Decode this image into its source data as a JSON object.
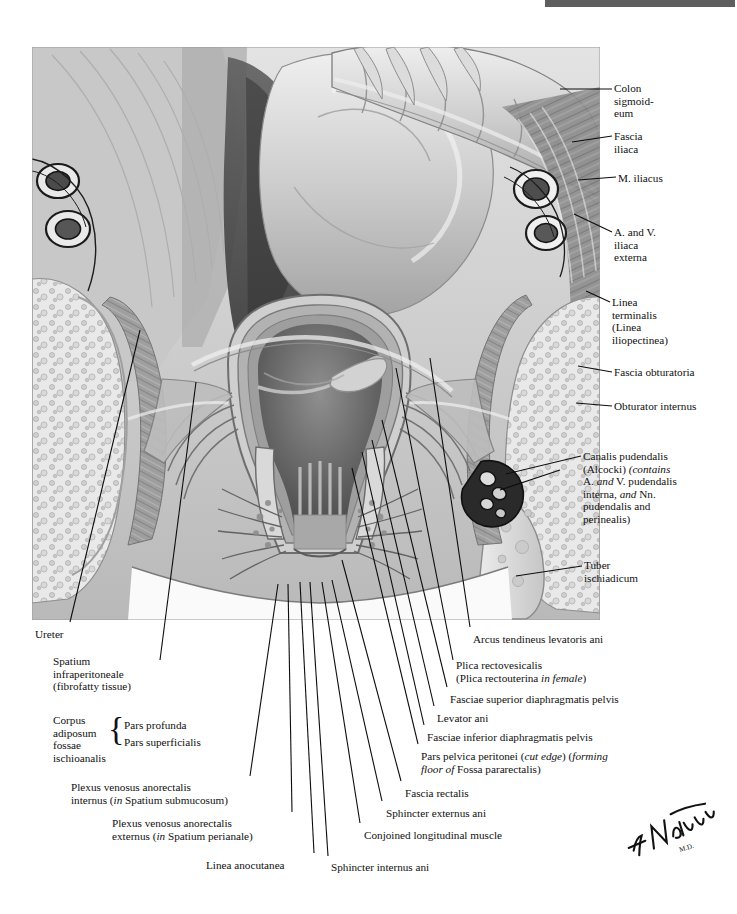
{
  "header": {
    "title": "SECTION PLATE 11-8"
  },
  "plate": {
    "title": "Rectum and Anal Canal — Coronal Section",
    "signature": "F. Netter"
  },
  "labels_right": [
    {
      "key": "colon_sigmoideum",
      "text": "Colon\nsigmoid-\neum",
      "x": 614,
      "y": 82
    },
    {
      "key": "fascia_iliaca",
      "text": "Fascia\niliaca",
      "x": 614,
      "y": 130
    },
    {
      "key": "m_iliacus",
      "text": "M. iliacus",
      "x": 618,
      "y": 172
    },
    {
      "key": "a_and_v_iliaca_externa",
      "text": "A. and V.\niliaca\nexterna",
      "x": 614,
      "y": 226
    },
    {
      "key": "linea_terminalis",
      "text": "Linea\nterminalis\n(Linea\niliopectinea)",
      "x": 612,
      "y": 296
    },
    {
      "key": "fascia_obturatoria",
      "text": "Fascia obturatoria",
      "x": 614,
      "y": 366
    },
    {
      "key": "obturator_internus",
      "text": "Obturator internus",
      "x": 614,
      "y": 400
    },
    {
      "key": "tuber_ischiadicum",
      "text": "Tuber\nischiadicum",
      "x": 584,
      "y": 559
    }
  ],
  "label_canalis_pudendalis": {
    "key": "canalis_pudendalis",
    "lines": [
      [
        {
          "t": "Canalis pudendalis"
        }
      ],
      [
        {
          "t": "(Alcocki) "
        },
        {
          "t": "(contains",
          "i": true
        }
      ],
      [
        {
          "t": "A. "
        },
        {
          "t": "and",
          "i": true
        },
        {
          "t": " V. pudendalis"
        }
      ],
      [
        {
          "t": "interna, "
        },
        {
          "t": "and",
          "i": true
        },
        {
          "t": " Nn."
        }
      ],
      [
        {
          "t": "pudendalis and"
        }
      ],
      [
        {
          "t": "perinealis)"
        }
      ]
    ],
    "x": 583,
    "y": 450
  },
  "labels_bottom_left": [
    {
      "key": "ureter",
      "text": "Ureter",
      "x": 35,
      "y": 628,
      "align": "left"
    },
    {
      "key": "spatium_infraperitoneale",
      "text": "Spatium\ninfraperitoneale\n(fibrofatty tissue)",
      "x": 53,
      "y": 655,
      "align": "left"
    },
    {
      "key": "corpus_adiposum",
      "text": "Corpus\nadiposum\nfossae\nischioanalis",
      "x": 53,
      "y": 714,
      "align": "left"
    },
    {
      "key": "pars_profunda",
      "text": "Pars profunda",
      "x": 124,
      "y": 719,
      "align": "left"
    },
    {
      "key": "pars_superficialis",
      "text": "Pars superficialis",
      "x": 124,
      "y": 736,
      "align": "left"
    }
  ],
  "label_plexus_internus": {
    "key": "plexus_venosus_anorectalis_internus",
    "lines": [
      [
        {
          "t": "Plexus venosus anorectalis"
        }
      ],
      [
        {
          "t": "internus ("
        },
        {
          "t": "in",
          "i": true
        },
        {
          "t": " Spatium submucosum)"
        }
      ]
    ],
    "x": 71,
    "y": 781,
    "align": "left"
  },
  "label_plexus_externus": {
    "key": "plexus_venosus_anorectalis_externus",
    "lines": [
      [
        {
          "t": "Plexus venosus anorectalis"
        }
      ],
      [
        {
          "t": "externus ("
        },
        {
          "t": "in",
          "i": true
        },
        {
          "t": " Spatium perianale)"
        }
      ]
    ],
    "x": 112,
    "y": 817,
    "align": "left"
  },
  "label_linea_anocutanea": {
    "key": "linea_anocutanea",
    "text": "Linea anocutanea",
    "x": 206,
    "y": 859
  },
  "labels_bottom_right": [
    {
      "key": "arcus_tendineus",
      "text": "Arcus tendineus levatoris ani",
      "x": 473,
      "y": 633
    },
    {
      "key": "fasciae_superior",
      "text": "Fasciae superior diaphragmatis pelvis",
      "x": 450,
      "y": 693
    },
    {
      "key": "levator_ani",
      "text": "Levator ani",
      "x": 437,
      "y": 712
    },
    {
      "key": "fasciae_inferior",
      "text": "Fasciae inferior diaphragmatis pelvis",
      "x": 427,
      "y": 731
    },
    {
      "key": "fascia_rectalis",
      "text": "Fascia rectalis",
      "x": 405,
      "y": 787
    },
    {
      "key": "sphincter_externus_ani",
      "text": "Sphincter externus ani",
      "x": 386,
      "y": 807
    },
    {
      "key": "conjoined_longitudinal_muscle",
      "text": "Conjoined longitudinal muscle",
      "x": 364,
      "y": 829
    },
    {
      "key": "sphincter_internus_ani",
      "text": "Sphincter internus ani",
      "x": 331,
      "y": 861
    }
  ],
  "label_plica_rectovesicalis": {
    "key": "plica_rectovesicalis",
    "lines": [
      [
        {
          "t": "Plica rectovesicalis"
        }
      ],
      [
        {
          "t": "(Plica rectouterina "
        },
        {
          "t": "in female",
          "i": true
        },
        {
          "t": ")"
        }
      ]
    ],
    "x": 456,
    "y": 659
  },
  "label_pars_pelvica": {
    "key": "pars_pelvica_peritonei",
    "lines": [
      [
        {
          "t": "Pars pelvica peritonei ("
        },
        {
          "t": "cut edge",
          "i": true
        },
        {
          "t": ") ("
        },
        {
          "t": "forming",
          "i": true
        }
      ],
      [
        {
          "t": "floor of",
          "i": true
        },
        {
          "t": " Fossa pararectalis)"
        }
      ]
    ],
    "x": 421,
    "y": 750
  },
  "colors": {
    "ink": "#101010",
    "leader": "#0d0d0d",
    "header_bar": "#5e5e5e",
    "plate_bg": "#cfcfcf"
  },
  "leaders": [
    {
      "name": "leader-colon-sigmoideum",
      "d": "M 612 89 L 560 89"
    },
    {
      "name": "leader-fascia-iliaca",
      "d": "M 612 136 L 572 142"
    },
    {
      "name": "leader-m-iliacus",
      "d": "M 616 177 L 578 180"
    },
    {
      "name": "leader-a-v-iliaca-externa",
      "d": "M 612 232 L 574 214"
    },
    {
      "name": "leader-linea-terminalis",
      "d": "M 610 302 L 586 291"
    },
    {
      "name": "leader-fascia-obturatoria",
      "d": "M 612 372 L 578 366"
    },
    {
      "name": "leader-obturator-internus",
      "d": "M 612 406 L 576 403"
    },
    {
      "name": "leader-canalis-pudendalis-1",
      "d": "M 581 456 L 506 474"
    },
    {
      "name": "leader-canalis-pudendalis-2",
      "d": "M 560 470 L 500 490"
    },
    {
      "name": "leader-tuber-ischiadicum",
      "d": "M 582 566 L 516 576"
    },
    {
      "name": "leader-ureter",
      "d": "M 70 622 L 140 330"
    },
    {
      "name": "leader-spatium-infra",
      "d": "M 160 660 L 196 382"
    },
    {
      "name": "leader-plexus-internus",
      "d": "M 250 776 L 278 584"
    },
    {
      "name": "leader-plexus-externus",
      "d": "M 292 812 L 288 584"
    },
    {
      "name": "leader-linea-anocutanea",
      "d": "M 314 853 L 300 582"
    },
    {
      "name": "leader-sphincter-internus-ani",
      "d": "M 328 856 L 310 582"
    },
    {
      "name": "leader-conjoined-long-muscle",
      "d": "M 360 823 L 322 582"
    },
    {
      "name": "leader-sphincter-externus-ani",
      "d": "M 382 801 L 332 580"
    },
    {
      "name": "leader-fascia-rectalis",
      "d": "M 401 781 L 342 560"
    },
    {
      "name": "leader-pars-pelvica",
      "d": "M 418 744 L 352 468"
    },
    {
      "name": "leader-fasciae-inferior",
      "d": "M 424 725 L 362 452"
    },
    {
      "name": "leader-levator-ani",
      "d": "M 434 706 L 372 440"
    },
    {
      "name": "leader-fasciae-superior",
      "d": "M 447 687 L 382 420"
    },
    {
      "name": "leader-plica-rectovesicalis",
      "d": "M 453 660 L 396 368"
    },
    {
      "name": "leader-arcus-tendineus",
      "d": "M 470 627 L 430 358"
    }
  ]
}
